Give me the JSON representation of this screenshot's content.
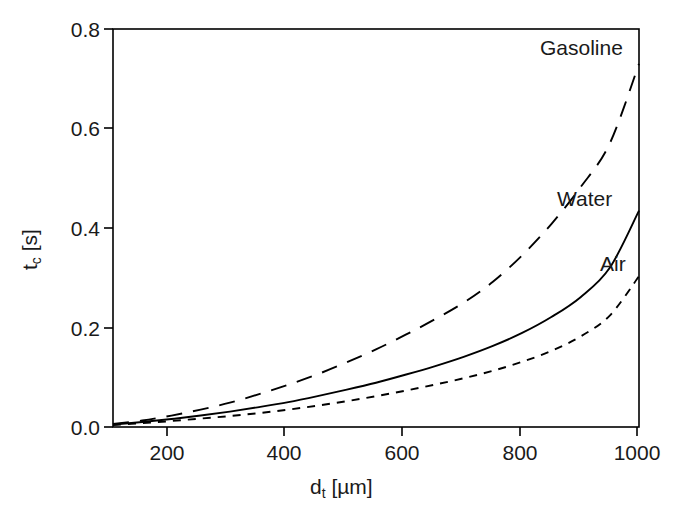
{
  "chart_data": {
    "type": "line",
    "title": "",
    "subtitle": "",
    "xlabel_text": "d",
    "xlabel_sub": "t",
    "xlabel_unit": " [µm]",
    "ylabel_text": "t",
    "ylabel_sub": "c",
    "ylabel_unit": " [s]",
    "xlim": [
      100,
      1000
    ],
    "ylim": [
      0.0,
      0.8
    ],
    "xticks": [
      200,
      400,
      600,
      800,
      1000
    ],
    "xtick_labels": [
      "200",
      "400",
      "600",
      "800",
      "1000"
    ],
    "yticks": [
      0.0,
      0.2,
      0.4,
      0.6,
      0.8
    ],
    "ytick_labels": [
      "0.0",
      "0.2",
      "0.4",
      "0.6",
      "0.8"
    ],
    "grid": false,
    "legend_position": "inline-annotations",
    "frame": "box",
    "line_color": "#000000",
    "x": [
      100,
      150,
      200,
      250,
      300,
      350,
      400,
      450,
      500,
      550,
      600,
      650,
      700,
      750,
      800,
      850,
      900,
      950,
      1000
    ],
    "series": [
      {
        "name": "Gasoline",
        "dash": "long-dash",
        "linestyle": "dashed",
        "label_x": 1000,
        "label_y": 0.79,
        "values": [
          0.006,
          0.013,
          0.023,
          0.035,
          0.049,
          0.066,
          0.085,
          0.106,
          0.13,
          0.156,
          0.185,
          0.216,
          0.25,
          0.292,
          0.345,
          0.408,
          0.482,
          0.57,
          0.73
        ]
      },
      {
        "name": "Water",
        "dash": "solid",
        "linestyle": "solid",
        "label_x": 1000,
        "label_y": 0.48,
        "values": [
          0.005,
          0.01,
          0.016,
          0.023,
          0.031,
          0.04,
          0.05,
          0.062,
          0.075,
          0.089,
          0.105,
          0.122,
          0.141,
          0.163,
          0.189,
          0.221,
          0.261,
          0.32,
          0.435
        ]
      },
      {
        "name": "Air",
        "dash": "short-dash",
        "linestyle": "dotted",
        "label_x": 1000,
        "label_y": 0.34,
        "values": [
          0.004,
          0.008,
          0.012,
          0.017,
          0.022,
          0.028,
          0.035,
          0.043,
          0.052,
          0.062,
          0.073,
          0.085,
          0.098,
          0.113,
          0.131,
          0.153,
          0.182,
          0.224,
          0.303
        ]
      }
    ],
    "annotations": [
      {
        "text": "Gasoline",
        "left": 540,
        "top": 36
      },
      {
        "text": "Water",
        "left": 557,
        "top": 187
      },
      {
        "text": "Air",
        "left": 600,
        "top": 252
      }
    ]
  },
  "axis": {
    "x_tick_positions_px": [
      167,
      284,
      402,
      520,
      637
    ],
    "y_tick_positions_px": [
      427,
      328,
      228,
      128,
      29
    ],
    "plot_left_px": 113,
    "plot_right_px": 639,
    "plot_top_px": 29,
    "plot_bottom_px": 427
  }
}
